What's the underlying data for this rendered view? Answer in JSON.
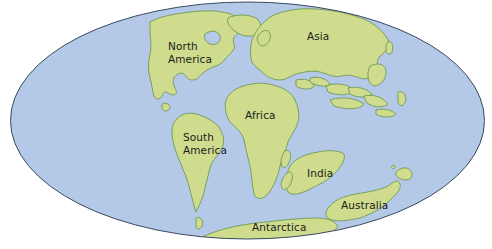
{
  "map": {
    "projection": "Mollweide-style ellipse",
    "colors": {
      "ocean": "#b4c8e7",
      "land": "#cfdc8e",
      "coastline": "#6f9a54",
      "outline": "#3a4a5e",
      "background": "#ffffff",
      "label_text": "#1b1b1b"
    },
    "labels": {
      "north_america": {
        "line1": "North",
        "line2": "America"
      },
      "asia": "Asia",
      "africa": "Africa",
      "south_america": {
        "line1": "South",
        "line2": "America"
      },
      "india": "India",
      "australia": "Australia",
      "antarctica": "Antarctica"
    }
  }
}
